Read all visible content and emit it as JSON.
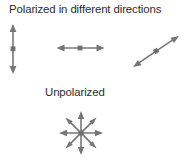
{
  "diagram": {
    "background_color": "#ffffff",
    "stroke_color": "#767676",
    "text_color": "#2b2b2b",
    "title": "Polarized in different directions",
    "unpolarized_label": "Unpolarized",
    "polarized_arrows": [
      {
        "name": "vertical-polarization-arrow",
        "orientation": "vertical",
        "angle_deg": 90,
        "double_headed": true,
        "center": [
          13,
          49
        ],
        "length": 48
      },
      {
        "name": "horizontal-polarization-arrow",
        "orientation": "horizontal",
        "angle_deg": 0,
        "double_headed": true,
        "center": [
          80,
          48
        ],
        "length": 47
      },
      {
        "name": "diagonal-polarization-arrow",
        "orientation": "diagonal",
        "angle_deg": 34,
        "double_headed": true,
        "center": [
          156,
          51
        ],
        "length": 55
      }
    ],
    "unpolarized_starburst": {
      "name": "unpolarized-starburst",
      "center": [
        81,
        133
      ],
      "radius": 22,
      "ray_count": 8,
      "double_headed": true,
      "ray_angles_deg": [
        0,
        45,
        90,
        135,
        180,
        225,
        270,
        315
      ]
    }
  }
}
